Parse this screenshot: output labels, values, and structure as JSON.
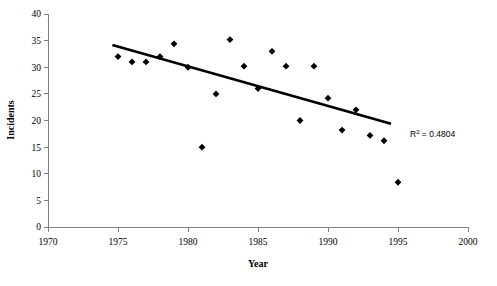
{
  "chart_data": {
    "type": "scatter",
    "title": "",
    "xlabel": "Year",
    "ylabel": "Incidents",
    "xlim": [
      1970,
      2000
    ],
    "ylim": [
      0,
      40
    ],
    "xticks": [
      1970,
      1975,
      1980,
      1985,
      1990,
      1995,
      2000
    ],
    "yticks": [
      0,
      5,
      10,
      15,
      20,
      25,
      30,
      35,
      40
    ],
    "grid": false,
    "legend": false,
    "series": [
      {
        "name": "Incidents",
        "marker": "diamond",
        "color": "#000000",
        "points": [
          {
            "x": 1975,
            "y": 32
          },
          {
            "x": 1976,
            "y": 31
          },
          {
            "x": 1977,
            "y": 31
          },
          {
            "x": 1978,
            "y": 32
          },
          {
            "x": 1979,
            "y": 34.4
          },
          {
            "x": 1980,
            "y": 30
          },
          {
            "x": 1981,
            "y": 15
          },
          {
            "x": 1982,
            "y": 25
          },
          {
            "x": 1983,
            "y": 35.2
          },
          {
            "x": 1984,
            "y": 30.2
          },
          {
            "x": 1985,
            "y": 26
          },
          {
            "x": 1986,
            "y": 33
          },
          {
            "x": 1987,
            "y": 30.2
          },
          {
            "x": 1988,
            "y": 20
          },
          {
            "x": 1989,
            "y": 30.2
          },
          {
            "x": 1990,
            "y": 24.2
          },
          {
            "x": 1991,
            "y": 18.2
          },
          {
            "x": 1992,
            "y": 22
          },
          {
            "x": 1993,
            "y": 17.2
          },
          {
            "x": 1994,
            "y": 16.2
          },
          {
            "x": 1995,
            "y": 8.4
          }
        ]
      }
    ],
    "trendline": {
      "type": "linear",
      "x_start": 1974.6,
      "y_start": 34.2,
      "x_end": 1994.5,
      "y_end": 19.4,
      "r2_label": "R² = 0.4804",
      "r2_value": 0.4804,
      "r2_prefix": "R",
      "r2_exponent": "2",
      "r2_suffix": " = 0.4804"
    }
  },
  "axes": {
    "x_title": "Year",
    "y_title": "Incidents",
    "x_tick_labels": [
      "1970",
      "1975",
      "1980",
      "1985",
      "1990",
      "1995",
      "2000"
    ],
    "y_tick_labels": [
      "0",
      "5",
      "10",
      "15",
      "20",
      "25",
      "30",
      "35",
      "40"
    ]
  },
  "colors": {
    "marker": "#000000",
    "trend": "#000000",
    "axis": "#808080",
    "background": "#ffffff"
  }
}
